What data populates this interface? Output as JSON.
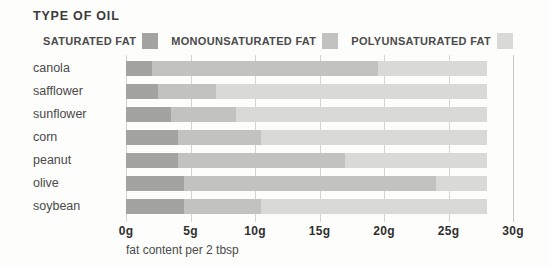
{
  "title": "TYPE OF OIL",
  "legend": [
    {
      "key": "saturated",
      "label": "SATURATED FAT",
      "color": "#a3a3a2"
    },
    {
      "key": "monounsaturated",
      "label": "MONOUNSATURATED FAT",
      "color": "#c2c2c0"
    },
    {
      "key": "polyunsaturated",
      "label": "POLYUNSATURATED FAT",
      "color": "#d9d9d7"
    }
  ],
  "chart_data": {
    "type": "bar",
    "orientation": "horizontal",
    "stacked": true,
    "title": "TYPE OF OIL",
    "xlabel": "fat content per 2 tbsp",
    "ylabel": "",
    "xlim": [
      0,
      30
    ],
    "grid": "vertical",
    "legend_position": "top",
    "categories": [
      "canola",
      "safflower",
      "sunflower",
      "corn",
      "peanut",
      "olive",
      "soybean"
    ],
    "x_ticks": [
      "0g",
      "5g",
      "10g",
      "15g",
      "20g",
      "25g",
      "30g"
    ],
    "x_tick_values": [
      0,
      5,
      10,
      15,
      20,
      25,
      30
    ],
    "units": "g",
    "series": [
      {
        "name": "SATURATED FAT",
        "values": [
          2.0,
          2.5,
          3.5,
          4.0,
          4.0,
          4.5,
          4.5
        ]
      },
      {
        "name": "MONOUNSATURATED FAT",
        "values": [
          17.5,
          4.5,
          5.0,
          6.5,
          13.0,
          19.5,
          6.0
        ]
      },
      {
        "name": "POLYUNSATURATED FAT",
        "values": [
          8.5,
          21.0,
          19.5,
          17.5,
          11.0,
          4.0,
          17.5
        ]
      }
    ],
    "bar_total_each": 28.0
  }
}
